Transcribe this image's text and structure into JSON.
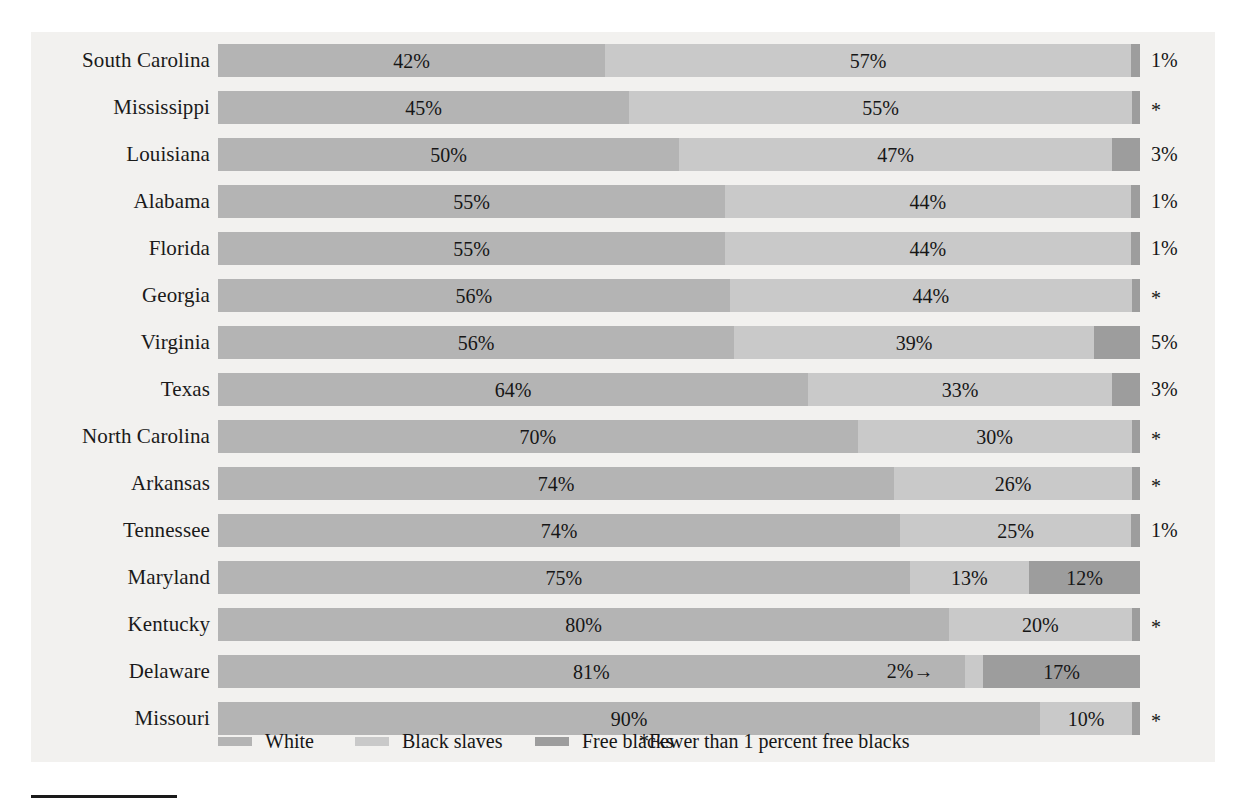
{
  "chart_data": {
    "type": "bar",
    "title": "",
    "subtitle": "",
    "xlabel": "",
    "ylabel": "",
    "orientation": "horizontal",
    "stacked": true,
    "xlim": [
      0,
      100
    ],
    "grid": false,
    "legend_position": "bottom-left",
    "categories": [
      "South Carolina",
      "Mississippi",
      "Louisiana",
      "Alabama",
      "Florida",
      "Georgia",
      "Virginia",
      "Texas",
      "North Carolina",
      "Arkansas",
      "Tennessee",
      "Maryland",
      "Kentucky",
      "Delaware",
      "Missouri"
    ],
    "series": [
      {
        "name": "White",
        "color": "#b4b4b4",
        "values": [
          42,
          45,
          50,
          55,
          55,
          56,
          56,
          64,
          70,
          74,
          74,
          75,
          80,
          81,
          90
        ]
      },
      {
        "name": "Black slaves",
        "color": "#c9c9c9",
        "values": [
          57,
          55,
          47,
          44,
          44,
          44,
          39,
          33,
          30,
          26,
          25,
          13,
          20,
          2,
          10
        ]
      },
      {
        "name": "Free blacks",
        "color": "#9d9d9d",
        "values": [
          1,
          0.5,
          3,
          1,
          1,
          0.5,
          5,
          3,
          0.5,
          0.5,
          1,
          12,
          0.5,
          17,
          0.5
        ]
      }
    ],
    "rows": [
      {
        "state": "South Carolina",
        "white_label": "42%",
        "slave_label": "57%",
        "free_label": "1%",
        "free_outside": true,
        "white": 42,
        "slave": 57,
        "free": 1
      },
      {
        "state": "Mississippi",
        "white_label": "45%",
        "slave_label": "55%",
        "free_label": "*",
        "free_outside": true,
        "white": 45,
        "slave": 55,
        "free": 0
      },
      {
        "state": "Louisiana",
        "white_label": "50%",
        "slave_label": "47%",
        "free_label": "3%",
        "free_outside": true,
        "white": 50,
        "slave": 47,
        "free": 3
      },
      {
        "state": "Alabama",
        "white_label": "55%",
        "slave_label": "44%",
        "free_label": "1%",
        "free_outside": true,
        "white": 55,
        "slave": 44,
        "free": 1
      },
      {
        "state": "Florida",
        "white_label": "55%",
        "slave_label": "44%",
        "free_label": "1%",
        "free_outside": true,
        "white": 55,
        "slave": 44,
        "free": 1
      },
      {
        "state": "Georgia",
        "white_label": "56%",
        "slave_label": "44%",
        "free_label": "*",
        "free_outside": true,
        "white": 56,
        "slave": 44,
        "free": 0
      },
      {
        "state": "Virginia",
        "white_label": "56%",
        "slave_label": "39%",
        "free_label": "5%",
        "free_outside": true,
        "white": 56,
        "slave": 39,
        "free": 5
      },
      {
        "state": "Texas",
        "white_label": "64%",
        "slave_label": "33%",
        "free_label": "3%",
        "free_outside": true,
        "white": 64,
        "slave": 33,
        "free": 3
      },
      {
        "state": "North Carolina",
        "white_label": "70%",
        "slave_label": "30%",
        "free_label": "*",
        "free_outside": true,
        "white": 70,
        "slave": 30,
        "free": 0
      },
      {
        "state": "Arkansas",
        "white_label": "74%",
        "slave_label": "26%",
        "free_label": "*",
        "free_outside": true,
        "white": 74,
        "slave": 26,
        "free": 0
      },
      {
        "state": "Tennessee",
        "white_label": "74%",
        "slave_label": "25%",
        "free_label": "1%",
        "free_outside": true,
        "white": 74,
        "slave": 25,
        "free": 1
      },
      {
        "state": "Maryland",
        "white_label": "75%",
        "slave_label": "13%",
        "free_label": "12%",
        "free_outside": false,
        "white": 75,
        "slave": 13,
        "free": 12
      },
      {
        "state": "Kentucky",
        "white_label": "80%",
        "slave_label": "20%",
        "free_label": "*",
        "free_outside": true,
        "white": 80,
        "slave": 20,
        "free": 0
      },
      {
        "state": "Delaware",
        "white_label": "81%",
        "slave_label": "2%→",
        "free_label": "17%",
        "free_outside": false,
        "white": 81,
        "slave": 2,
        "free": 17
      },
      {
        "state": "Missouri",
        "white_label": "90%",
        "slave_label": "10%",
        "free_label": "*",
        "free_outside": true,
        "white": 90,
        "slave": 10,
        "free": 0
      }
    ],
    "legend": [
      {
        "label": "White",
        "color": "#b4b4b4"
      },
      {
        "label": "Black slaves",
        "color": "#c9c9c9"
      },
      {
        "label": "Free blacks",
        "color": "#9d9d9d"
      }
    ],
    "footnote": "*Fewer than 1 percent free blacks"
  }
}
